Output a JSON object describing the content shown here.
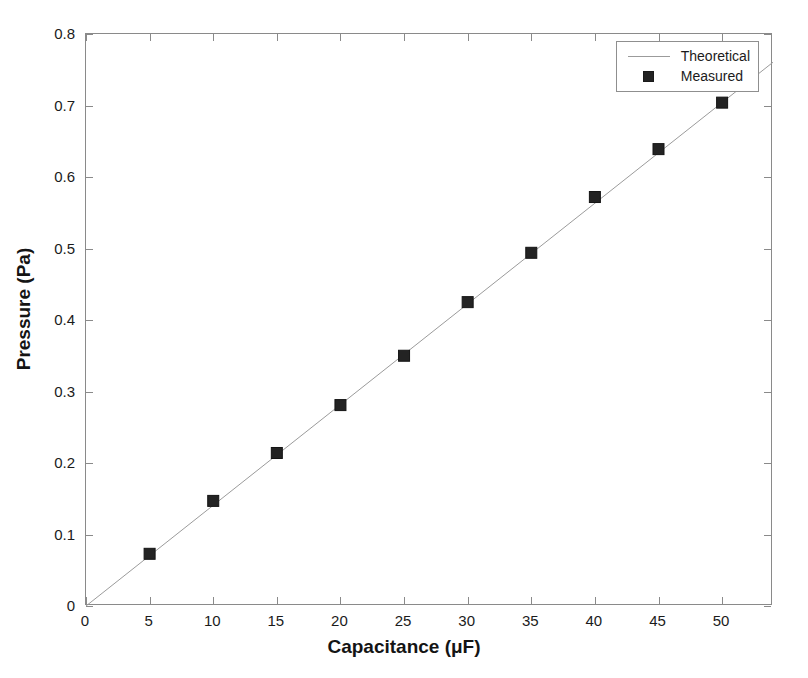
{
  "chart_data": {
    "type": "line",
    "title": "",
    "xlabel": "Capacitance (μF)",
    "ylabel": "Pressure (Pa)",
    "xlim": [
      0,
      54
    ],
    "ylim": [
      0,
      0.8
    ],
    "xticks": [
      0,
      5,
      10,
      15,
      20,
      25,
      30,
      35,
      40,
      45,
      50
    ],
    "xtick_labels": [
      "0",
      "5",
      "10",
      "15",
      "20",
      "25",
      "30",
      "35",
      "40",
      "45",
      "50"
    ],
    "yticks": [
      0,
      0.1,
      0.2,
      0.3,
      0.4,
      0.5,
      0.6,
      0.7,
      0.8
    ],
    "ytick_labels": [
      "0",
      "0.1",
      "0.2",
      "0.3",
      "0.4",
      "0.5",
      "0.6",
      "0.7",
      "0.8"
    ],
    "grid": false,
    "legend_position": "upper right",
    "legend_entries": [
      "Theoretical",
      "Measured"
    ],
    "series": [
      {
        "name": "Theoretical",
        "kind": "line",
        "color": "#9b9b9b",
        "x": [
          0,
          54
        ],
        "values": [
          0,
          0.7605
        ]
      },
      {
        "name": "Measured",
        "kind": "scatter",
        "marker": "square",
        "color": "#232323",
        "x": [
          5,
          10,
          15,
          20,
          25,
          30,
          35,
          40,
          45,
          50
        ],
        "values": [
          0.073,
          0.147,
          0.214,
          0.281,
          0.35,
          0.425,
          0.494,
          0.572,
          0.639,
          0.704
        ]
      }
    ]
  },
  "legend": {
    "theoretical_label": "Theoretical",
    "measured_label": "Measured"
  },
  "colors": {
    "axis": "#8a8a8a",
    "line": "#9b9b9b",
    "marker": "#232323",
    "text": "#1b1b1b",
    "background": "#ffffff"
  }
}
